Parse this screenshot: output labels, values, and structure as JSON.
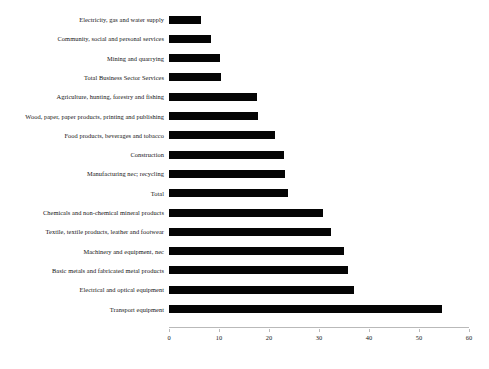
{
  "chart_data": {
    "type": "bar",
    "orientation": "horizontal",
    "title": "",
    "subtitle": "",
    "xlabel": "",
    "ylabel": "",
    "xlim": [
      0,
      60
    ],
    "ylim": null,
    "grid": false,
    "legend": null,
    "bar_color": "#050505",
    "axis_color": "#b9b9b9",
    "xticks": [
      0,
      10,
      20,
      30,
      40,
      50,
      60
    ],
    "xtick_labels": [
      "0",
      "10",
      "20",
      "30",
      "40",
      "50",
      "60"
    ],
    "categories": [
      "Electricity, gas and water supply",
      "Community, social and personal services",
      "Mining and quarrying",
      "Total Business Sector Services",
      "Agriculture, hunting, forestry and fishing",
      "Wood, paper, paper products, printing and publishing",
      "Food products, beverages and tobacco",
      "Construction",
      "Manufacturing nec; recycling",
      "Total",
      "Chemicals and non-chemical mineral products",
      "Textile, textile products, leather and footwear",
      "Machinery and equipment, nec",
      "Basic metals and fabricated metal products",
      "Electrical and optical equipment",
      "Transport equipment"
    ],
    "values": [
      6.4,
      8.4,
      10.2,
      10.4,
      17.6,
      17.8,
      21.2,
      23.0,
      23.2,
      23.8,
      30.8,
      32.4,
      35.0,
      35.8,
      37.0,
      54.6
    ]
  }
}
